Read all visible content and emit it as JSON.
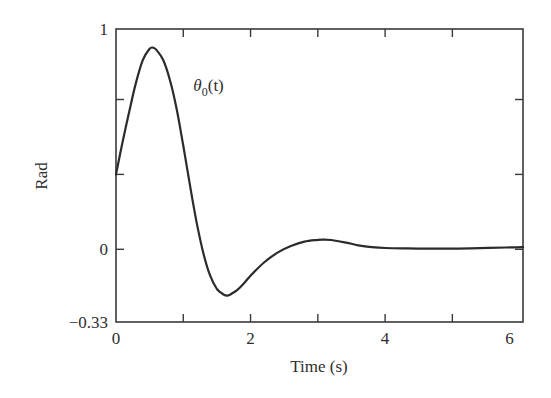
{
  "chart_data": {
    "type": "line",
    "title": "",
    "xlabel": "Time (s)",
    "ylabel": "Rad",
    "xlim": [
      0,
      6.05
    ],
    "ylim": [
      -0.33,
      1
    ],
    "grid": false,
    "legend": null,
    "x_ticks": [
      0,
      1,
      2,
      3,
      4,
      5,
      6
    ],
    "x_tick_labels": [
      {
        "value": 0,
        "label": "0"
      },
      {
        "value": 2,
        "label": "2"
      },
      {
        "value": 4,
        "label": "4"
      },
      {
        "value": 5.85,
        "label": "6"
      }
    ],
    "y_ticks": [
      -0.33,
      0,
      0.34,
      0.68,
      1
    ],
    "y_tick_labels": [
      {
        "value": 1,
        "label": "1"
      },
      {
        "value": 0,
        "label": "0"
      },
      {
        "value": -0.33,
        "label": "−0.33"
      }
    ],
    "annotations": [
      {
        "text_main": "θ",
        "text_sub": "0",
        "text_tail": "(t)",
        "x": 1.15,
        "y": 0.72
      }
    ],
    "series": [
      {
        "name": "θ₀(t)",
        "color": "#2b2b2b",
        "x": [
          0,
          0.1,
          0.2,
          0.3,
          0.4,
          0.5,
          0.55,
          0.6,
          0.7,
          0.8,
          0.9,
          1.0,
          1.1,
          1.2,
          1.3,
          1.4,
          1.5,
          1.6,
          1.65,
          1.7,
          1.8,
          1.9,
          2.0,
          2.2,
          2.4,
          2.6,
          2.8,
          3.0,
          3.1,
          3.2,
          3.4,
          3.6,
          3.8,
          4.0,
          4.3,
          4.6,
          5.0,
          5.4,
          5.8,
          6.05
        ],
        "values": [
          0.34,
          0.49,
          0.63,
          0.76,
          0.86,
          0.91,
          0.915,
          0.905,
          0.86,
          0.77,
          0.64,
          0.47,
          0.29,
          0.12,
          -0.02,
          -0.12,
          -0.18,
          -0.205,
          -0.21,
          -0.205,
          -0.185,
          -0.155,
          -0.12,
          -0.06,
          -0.015,
          0.015,
          0.035,
          0.043,
          0.044,
          0.042,
          0.032,
          0.018,
          0.01,
          0.006,
          0.004,
          0.003,
          0.003,
          0.005,
          0.008,
          0.01
        ]
      }
    ]
  }
}
